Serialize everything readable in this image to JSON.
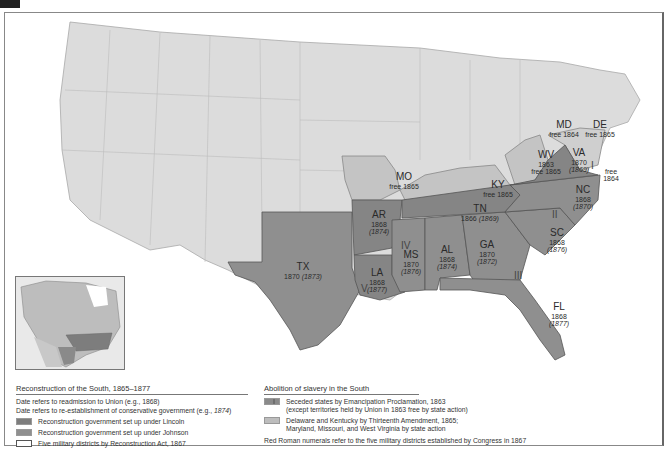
{
  "map": {
    "states": [
      {
        "abbr": "TX",
        "readmitted": "1870",
        "conservative": "(1873)",
        "group": "johnson"
      },
      {
        "abbr": "AR",
        "readmitted": "1868",
        "conservative": "(1874)",
        "group": "lincoln"
      },
      {
        "abbr": "LA",
        "readmitted": "1868",
        "conservative": "(1877)",
        "group": "lincoln"
      },
      {
        "abbr": "MS",
        "readmitted": "1870",
        "conservative": "(1876)",
        "group": "johnson"
      },
      {
        "abbr": "AL",
        "readmitted": "1868",
        "conservative": "(1874)",
        "group": "johnson"
      },
      {
        "abbr": "GA",
        "readmitted": "1870",
        "conservative": "(1872)",
        "group": "johnson"
      },
      {
        "abbr": "FL",
        "readmitted": "1868",
        "conservative": "(1877)",
        "group": "johnson"
      },
      {
        "abbr": "SC",
        "readmitted": "1868",
        "conservative": "(1876)",
        "group": "johnson"
      },
      {
        "abbr": "NC",
        "readmitted": "1868",
        "conservative": "(1870)",
        "group": "johnson"
      },
      {
        "abbr": "VA",
        "readmitted": "1870",
        "conservative": "(1869)",
        "group": "lincoln"
      },
      {
        "abbr": "TN",
        "readmitted": "1866",
        "conservative": "(1869)",
        "group": "lincoln"
      },
      {
        "abbr": "WV",
        "readmitted": "1863",
        "conservative": "free 1865",
        "group": "border"
      },
      {
        "abbr": "KY",
        "readmitted": "",
        "conservative": "free 1865",
        "group": "border"
      },
      {
        "abbr": "MO",
        "readmitted": "",
        "conservative": "free 1865",
        "group": "border"
      },
      {
        "abbr": "MD",
        "readmitted": "",
        "conservative": "free 1864",
        "group": "border"
      },
      {
        "abbr": "DE",
        "readmitted": "",
        "conservative": "free 1865",
        "group": "border"
      }
    ],
    "extra_labels": {
      "md_coast_free": "free",
      "md_coast_year": "1864"
    },
    "military_districts": [
      "I",
      "II",
      "III",
      "IV",
      "V"
    ]
  },
  "legend_reconstruction": {
    "title": "Reconstruction of the South, 1865–1877",
    "line1": "Date refers to readmission to Union (e.g., 1868)",
    "line2_prefix": "Date refers to re-establishment of conservative government (e.g., ",
    "line2_italic": "1874",
    "line2_suffix": ")",
    "items": [
      {
        "label": "Reconstruction government set up under Lincoln"
      },
      {
        "label": "Reconstruction government set up under Johnson"
      },
      {
        "label": "Five military districts by Reconstruction Act, 1867"
      }
    ]
  },
  "legend_abolition": {
    "title": "Abolition of slavery in the South",
    "items": [
      {
        "line1": "Seceded states by Emancipation Proclamation, 1863",
        "line2": "(except territories held by Union in 1863 free by state action)"
      },
      {
        "line1": "Delaware and Kentucky by Thirteenth Amendment, 1865;",
        "line2": "Maryland, Missouri, and West Virginia by state action"
      }
    ],
    "note": "Red Roman numerals refer to the five military districts established by Congress in 1867"
  },
  "colors": {
    "lincoln": "#7d7d7d",
    "johnson": "#8f8f8f",
    "border": "#bdbdbd",
    "other": "#d6d6d6",
    "water": "#ffffff"
  }
}
